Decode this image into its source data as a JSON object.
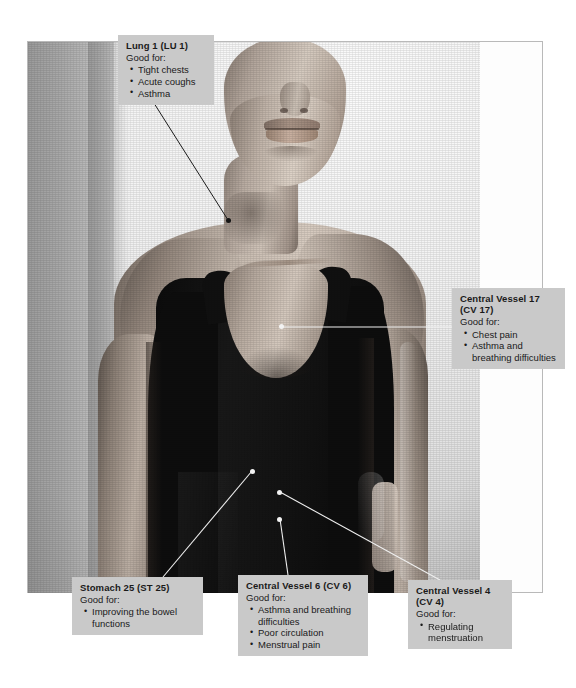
{
  "figure": {
    "type": "annotated-photograph",
    "purpose": "acupressure / acupuncture point location chart"
  },
  "points": [
    {
      "id": "lu1",
      "title": "Lung 1 (LU 1)",
      "good_for_label": "Good for:",
      "uses": [
        "Tight chests",
        "Acute coughs",
        "Asthma"
      ],
      "marker_color": "#141414",
      "marker_x": 228,
      "marker_y": 220,
      "leader_from_x": 152,
      "leader_from_y": 100,
      "label_position": "top-left"
    },
    {
      "id": "cv17",
      "title": "Central Vessel 17\n(CV 17)",
      "good_for_label": "Good for:",
      "uses": [
        "Chest pain",
        "Asthma and breathing difficulties"
      ],
      "marker_color": "#f2f2f2",
      "marker_x": 282,
      "marker_y": 327,
      "leader_from_x": 452,
      "leader_from_y": 327,
      "label_position": "middle-right"
    },
    {
      "id": "st25",
      "title": "Stomach 25 (ST 25)",
      "good_for_label": "Good for:",
      "uses": [
        "Improving the bowel functions"
      ],
      "marker_color": "#f2f2f2",
      "marker_x": 252,
      "marker_y": 471,
      "leader_from_x": 163,
      "leader_from_y": 577,
      "label_position": "bottom-left"
    },
    {
      "id": "cv6",
      "title": "Central Vessel 6 (CV 6)",
      "good_for_label": "Good for:",
      "uses": [
        "Asthma and breathing difficulties",
        "Poor circulation",
        "Menstrual pain"
      ],
      "marker_color": "#f2f2f2",
      "marker_x": 280,
      "marker_y": 519,
      "leader_from_x": 288,
      "leader_from_y": 575,
      "label_position": "bottom-center"
    },
    {
      "id": "cv4",
      "title": "Central Vessel 4\n(CV 4)",
      "good_for_label": "Good for:",
      "uses": [
        "Regulating menstruation"
      ],
      "marker_color": "#f2f2f2",
      "marker_x": 280,
      "marker_y": 492,
      "leader_from_x": 440,
      "leader_from_y": 580,
      "label_position": "bottom-right"
    }
  ],
  "colors": {
    "label_background": "#c9c9c9",
    "label_text": "#1a1a1a",
    "page_background": "#ffffff",
    "frame_border": "#b9b9b9",
    "leader_light": "#efefef",
    "leader_dark": "#1c1c1c",
    "garment": "#101010"
  }
}
